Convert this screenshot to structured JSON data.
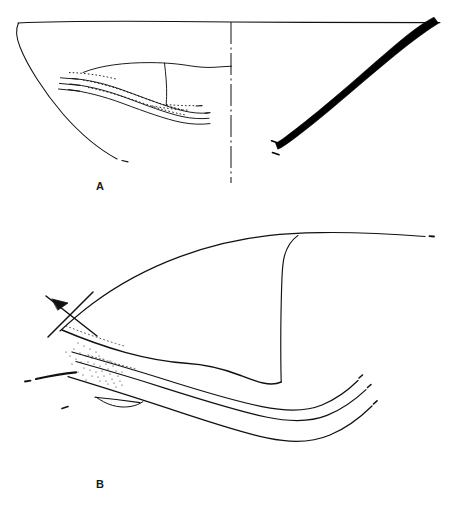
{
  "plate": {
    "type": "archaeological-illustration-plate",
    "background_color": "#ffffff",
    "ink_color": "#000000",
    "width": 450,
    "height": 509,
    "header_ghost_text": "p. 8",
    "figures": [
      {
        "id": "A",
        "label": "A",
        "label_x": 96,
        "label_y": 182,
        "description": "Vessel profile drawing: outline half-section at left of a dash-dot centre line, solid black filled section at right",
        "centerline_style": "dash-dot",
        "centerline_x": 231,
        "centerline_y_start": 22,
        "centerline_y_end": 183,
        "rim_y": 22,
        "rim_x_start": 18,
        "rim_x_end": 440,
        "solid_fill_color": "#000000"
      },
      {
        "id": "B",
        "label": "B",
        "label_x": 96,
        "label_y": 479,
        "description": "Large vessel profile line drawing with stippled break areas and an X cross-hatch mark at the left",
        "rim_x_start": 60,
        "rim_x_end": 425,
        "stipple": true,
        "cross_mark": true
      }
    ]
  }
}
